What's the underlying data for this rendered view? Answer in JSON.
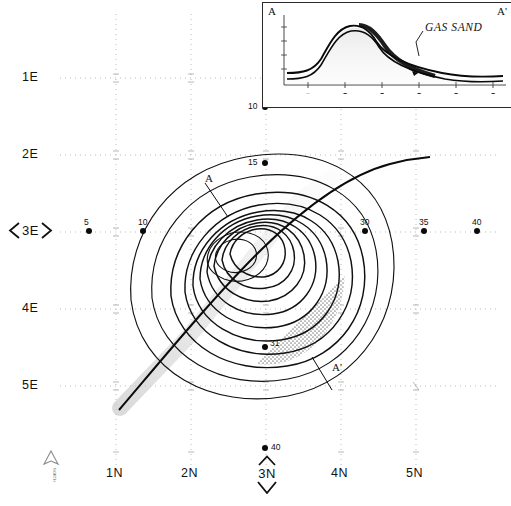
{
  "figure": {
    "type": "structure-contour-map",
    "north_arrow_label": "NORTH"
  },
  "axes": {
    "left_labels": [
      "1E",
      "2E",
      "3E",
      "4E",
      "5E"
    ],
    "left_highlight": "3E",
    "left_highlight_display": "3E",
    "bottom_labels": [
      "1N",
      "2N",
      "3N",
      "4N",
      "5N"
    ],
    "bottom_highlight": "3N"
  },
  "map": {
    "section_line_start_label": "A",
    "section_line_end_label": "A'",
    "wells": [
      {
        "id": "10",
        "label": "10",
        "x": 265,
        "y": 107
      },
      {
        "id": "15",
        "label": "15",
        "x": 265,
        "y": 163
      },
      {
        "id": "5",
        "label": "5",
        "x": 89,
        "y": 231
      },
      {
        "id": "10b",
        "label": "10",
        "x": 143,
        "y": 231
      },
      {
        "id": "30",
        "label": "30",
        "x": 365,
        "y": 231
      },
      {
        "id": "35",
        "label": "35",
        "x": 424,
        "y": 231
      },
      {
        "id": "40",
        "label": "40",
        "x": 477,
        "y": 231
      },
      {
        "id": "31",
        "label": "31",
        "x": 265,
        "y": 347
      },
      {
        "id": "40b",
        "label": "40",
        "x": 265,
        "y": 448
      }
    ]
  },
  "inset": {
    "left_label": "A",
    "right_label": "A'",
    "annotation": "GAS SAND"
  }
}
